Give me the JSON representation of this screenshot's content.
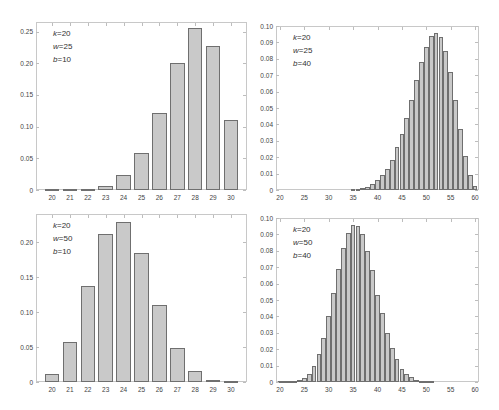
{
  "chart_data": [
    {
      "type": "bar",
      "title": "",
      "xlabel": "",
      "ylabel": "",
      "annotation": [
        "k=20",
        "w=25",
        "b=10"
      ],
      "categories": [
        20,
        21,
        22,
        23,
        24,
        25,
        26,
        27,
        28,
        29,
        30
      ],
      "values": [
        0.0001,
        0.0005,
        0.002,
        0.007,
        0.023,
        0.059,
        0.122,
        0.201,
        0.255,
        0.227,
        0.11
      ],
      "ylim": [
        0,
        0.265
      ],
      "yticks": [
        "0",
        "0.05",
        "0.10",
        "0.15",
        "0.20",
        "0.25"
      ],
      "ytick_values": [
        0,
        0.05,
        0.1,
        0.15,
        0.2,
        0.25
      ],
      "xticks": [
        "20",
        "21",
        "22",
        "23",
        "24",
        "25",
        "26",
        "27",
        "28",
        "29",
        "30"
      ],
      "grid": false
    },
    {
      "type": "bar",
      "title": "",
      "xlabel": "",
      "ylabel": "",
      "annotation": [
        "k=20",
        "w=25",
        "b=40"
      ],
      "categories": [
        20,
        21,
        22,
        23,
        24,
        25,
        26,
        27,
        28,
        29,
        30,
        31,
        32,
        33,
        34,
        35,
        36,
        37,
        38,
        39,
        40,
        41,
        42,
        43,
        44,
        45,
        46,
        47,
        48,
        49,
        50,
        51,
        52,
        53,
        54,
        55,
        56,
        57,
        58,
        59,
        60
      ],
      "values": [
        0,
        0,
        0,
        0,
        0,
        0,
        0,
        0,
        0,
        0,
        0,
        0,
        0,
        0,
        0,
        0.0002,
        0.0005,
        0.001,
        0.002,
        0.0035,
        0.006,
        0.009,
        0.013,
        0.018,
        0.026,
        0.034,
        0.044,
        0.055,
        0.067,
        0.078,
        0.087,
        0.094,
        0.096,
        0.093,
        0.085,
        0.072,
        0.055,
        0.037,
        0.021,
        0.009,
        0.0025
      ],
      "ylim": [
        0,
        0.1
      ],
      "yticks": [
        "0",
        "0.01",
        "0.02",
        "0.03",
        "0.04",
        "0.05",
        "0.06",
        "0.07",
        "0.08",
        "0.09",
        "0.10"
      ],
      "ytick_values": [
        0,
        0.01,
        0.02,
        0.03,
        0.04,
        0.05,
        0.06,
        0.07,
        0.08,
        0.09,
        0.1
      ],
      "xticks": [
        "20",
        "25",
        "30",
        "35",
        "40",
        "45",
        "50",
        "55",
        "60"
      ],
      "grid": false
    },
    {
      "type": "bar",
      "title": "",
      "xlabel": "",
      "ylabel": "",
      "annotation": [
        "k=20",
        "w=50",
        "b=10"
      ],
      "categories": [
        20,
        21,
        22,
        23,
        24,
        25,
        26,
        27,
        28,
        29,
        30
      ],
      "values": [
        0.011,
        0.057,
        0.137,
        0.211,
        0.229,
        0.184,
        0.11,
        0.049,
        0.016,
        0.003,
        0.0005
      ],
      "ylim": [
        0,
        0.24
      ],
      "yticks": [
        "0",
        "0.05",
        "0.10",
        "0.15",
        "0.20"
      ],
      "ytick_values": [
        0,
        0.05,
        0.1,
        0.15,
        0.2
      ],
      "xticks": [
        "20",
        "21",
        "22",
        "23",
        "24",
        "25",
        "26",
        "27",
        "28",
        "29",
        "30"
      ],
      "grid": false
    },
    {
      "type": "bar",
      "title": "",
      "xlabel": "",
      "ylabel": "",
      "annotation": [
        "k=20",
        "w=50",
        "b=40"
      ],
      "categories": [
        20,
        21,
        22,
        23,
        24,
        25,
        26,
        27,
        28,
        29,
        30,
        31,
        32,
        33,
        34,
        35,
        36,
        37,
        38,
        39,
        40,
        41,
        42,
        43,
        44,
        45,
        46,
        47,
        48,
        49,
        50,
        51,
        52,
        53,
        54,
        55,
        56,
        57,
        58,
        59,
        60
      ],
      "values": [
        0.0001,
        0.0002,
        0.0004,
        0.0006,
        0.001,
        0.0025,
        0.005,
        0.01,
        0.017,
        0.027,
        0.04,
        0.054,
        0.069,
        0.082,
        0.091,
        0.096,
        0.095,
        0.09,
        0.08,
        0.068,
        0.053,
        0.042,
        0.03,
        0.021,
        0.014,
        0.008,
        0.005,
        0.003,
        0.0015,
        0.0007,
        0.0003,
        0.0001,
        0,
        0,
        0,
        0,
        0,
        0,
        0,
        0,
        0
      ],
      "ylim": [
        0,
        0.1
      ],
      "yticks": [
        "0",
        "0.01",
        "0.02",
        "0.03",
        "0.04",
        "0.05",
        "0.06",
        "0.07",
        "0.08",
        "0.09",
        "0.10"
      ],
      "ytick_values": [
        0,
        0.01,
        0.02,
        0.03,
        0.04,
        0.05,
        0.06,
        0.07,
        0.08,
        0.09,
        0.1
      ],
      "xticks": [
        "20",
        "25",
        "30",
        "35",
        "40",
        "45",
        "50",
        "55",
        "60"
      ],
      "grid": false
    }
  ],
  "panels": [
    {
      "left": 36,
      "top": 22,
      "right": 247,
      "bottom": 190,
      "x0": 20,
      "x1": 30,
      "xpad": 0.9,
      "barw": 0.82,
      "ymax": 0.265,
      "xtick_values": [
        20,
        21,
        22,
        23,
        24,
        25,
        26,
        27,
        28,
        29,
        30
      ]
    },
    {
      "left": 276,
      "top": 26,
      "right": 479,
      "bottom": 190,
      "x0": 20,
      "x1": 60,
      "xpad": 0.8,
      "barw": 0.98,
      "ymax": 0.1,
      "xtick_values": [
        20,
        25,
        30,
        35,
        40,
        45,
        50,
        55,
        60
      ]
    },
    {
      "left": 36,
      "top": 214,
      "right": 247,
      "bottom": 382,
      "x0": 20,
      "x1": 30,
      "xpad": 0.9,
      "barw": 0.82,
      "ymax": 0.24,
      "xtick_values": [
        20,
        21,
        22,
        23,
        24,
        25,
        26,
        27,
        28,
        29,
        30
      ]
    },
    {
      "left": 276,
      "top": 218,
      "right": 479,
      "bottom": 382,
      "x0": 20,
      "x1": 60,
      "xpad": 0.8,
      "barw": 0.98,
      "ymax": 0.1,
      "xtick_values": [
        20,
        25,
        30,
        35,
        40,
        45,
        50,
        55,
        60
      ]
    }
  ],
  "style": {
    "bar_fill": "#c9c9c9",
    "bar_edge": "#6f6f6f",
    "frame": "#c8c8c8",
    "text": "#444444"
  }
}
